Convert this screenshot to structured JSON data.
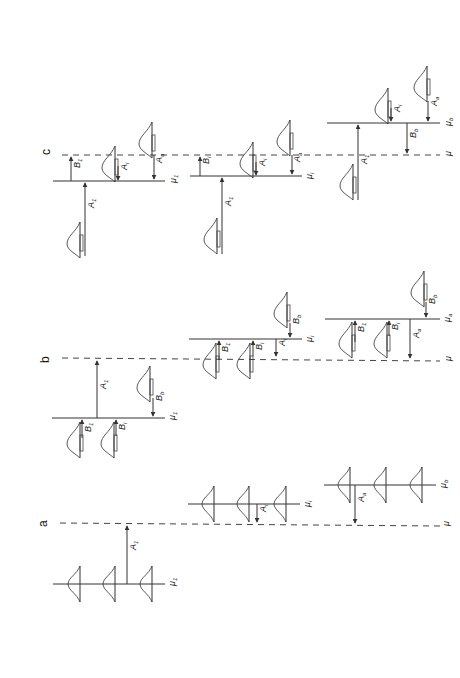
{
  "figure": {
    "orientation": "rotated-90-ccw",
    "panels": [
      {
        "id": "a",
        "label": "a",
        "mu_label": "μ",
        "groups": [
          {
            "name": "group-1",
            "line_label": "μ",
            "line_sub": "1",
            "arrows": [
              {
                "label": "A",
                "sub": "1",
                "direction": "up"
              }
            ]
          },
          {
            "name": "group-i",
            "line_label": "μ",
            "line_sub": "i",
            "arrows": [
              {
                "label": "A",
                "sub": "i",
                "direction": "down"
              }
            ]
          },
          {
            "name": "group-b",
            "line_label": "μ",
            "line_sub": "b",
            "arrows": [
              {
                "label": "A",
                "sub": "a",
                "direction": "down"
              }
            ]
          }
        ]
      },
      {
        "id": "b",
        "label": "b",
        "mu_label": "μ",
        "groups": [
          {
            "name": "group-1",
            "line_label": "μ",
            "line_sub": "1",
            "arrows": [
              {
                "label": "A",
                "sub": "1"
              },
              {
                "label": "B",
                "sub": "1"
              },
              {
                "label": "B",
                "sub": "i"
              },
              {
                "label": "B",
                "sub": "b"
              }
            ]
          },
          {
            "name": "group-i",
            "line_label": "μ",
            "line_sub": "i",
            "arrows": [
              {
                "label": "B",
                "sub": "1"
              },
              {
                "label": "B",
                "sub": "i"
              },
              {
                "label": "A",
                "sub": "i"
              },
              {
                "label": "B",
                "sub": "b"
              }
            ]
          },
          {
            "name": "group-b",
            "line_label": "μ",
            "line_sub": "a",
            "arrows": [
              {
                "label": "B",
                "sub": "1"
              },
              {
                "label": "B",
                "sub": "i"
              },
              {
                "label": "A",
                "sub": "a"
              },
              {
                "label": "B",
                "sub": "b"
              }
            ]
          }
        ]
      },
      {
        "id": "c",
        "label": "c",
        "mu_label": "μ",
        "groups": [
          {
            "name": "group-1",
            "line_label": "μ",
            "line_sub": "1",
            "arrows": [
              {
                "label": "A",
                "sub": "1"
              },
              {
                "label": "B",
                "sub": "1"
              },
              {
                "label": "A",
                "sub": "i"
              },
              {
                "label": "A",
                "sub": "a"
              }
            ]
          },
          {
            "name": "group-i",
            "line_label": "μ",
            "line_sub": "i",
            "arrows": [
              {
                "label": "A",
                "sub": "1"
              },
              {
                "label": "B",
                "sub": "i"
              },
              {
                "label": "A",
                "sub": "i"
              },
              {
                "label": "A",
                "sub": "a"
              }
            ]
          },
          {
            "name": "group-b",
            "line_label": "μ",
            "line_sub": "b",
            "arrows": [
              {
                "label": "A",
                "sub": "1"
              },
              {
                "label": "B",
                "sub": "b"
              },
              {
                "label": "A",
                "sub": "i"
              },
              {
                "label": "A",
                "sub": "a"
              }
            ]
          }
        ]
      }
    ]
  },
  "labels": {
    "panel_a": "a",
    "panel_b": "b",
    "panel_c": "c",
    "mu": "μ",
    "A": "A",
    "B": "B",
    "s1": "1",
    "si": "i",
    "sa": "a",
    "sb": "b"
  },
  "colors": {
    "stroke": "#333333",
    "background": "#ffffff"
  }
}
